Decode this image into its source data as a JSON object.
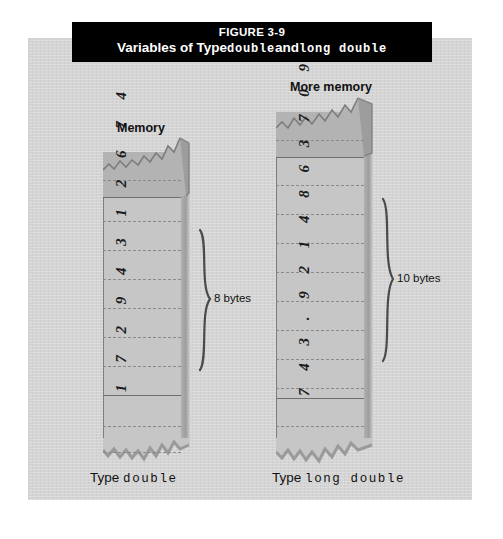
{
  "figure": {
    "number": "FIGURE 3-9",
    "title_prefix": "Variables of Type",
    "title_type_1": "double",
    "title_conjunction": "and",
    "title_type_2": "long double"
  },
  "columns": [
    {
      "id": "double",
      "memory_label": "Memory",
      "value_digits": "1 7 2 9 4 3 1 2 6 7 4",
      "size_label": "8 bytes",
      "caption_prefix": "Type",
      "caption_type": "double",
      "cell_count": 8
    },
    {
      "id": "long-double",
      "memory_label": "More memory",
      "value_digits": "7 4 3 . 9 2 1 4 8 6 3 7 0 9",
      "size_label": "10 bytes",
      "caption_prefix": "Type",
      "caption_type": "long double",
      "cell_count": 10
    }
  ],
  "colors": {
    "page_background": "#d4d4d4",
    "title_bar": "#000000",
    "title_text": "#ffffff",
    "column_fill": "#c6c6c6",
    "column_shade": "#b3b3b3",
    "line": "#6e6e6e",
    "dash": "#8a8a8a",
    "text": "#111111"
  }
}
